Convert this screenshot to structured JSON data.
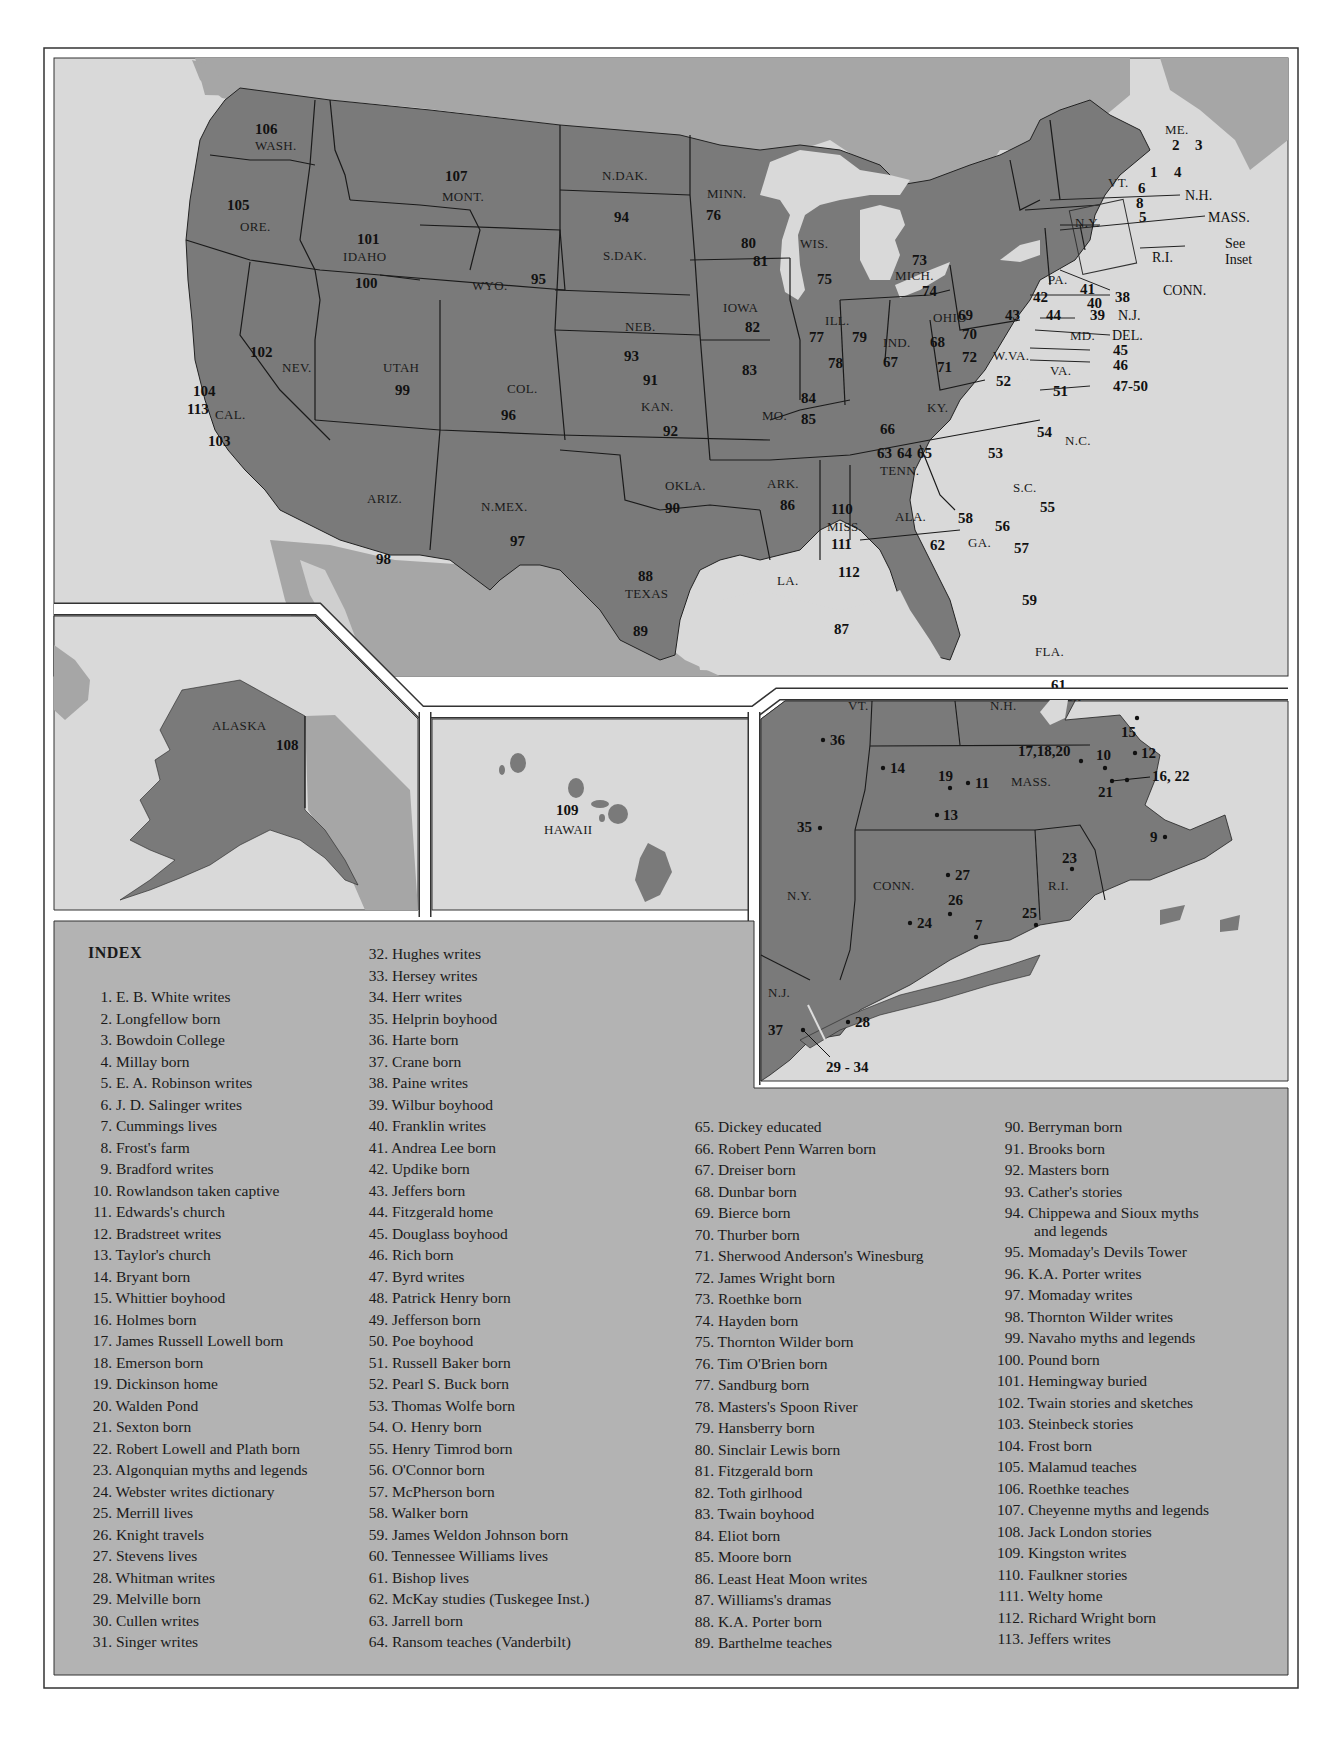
{
  "map": {
    "colors": {
      "us_land": "#7a7a7a",
      "foreign_land": "#a6a6a6",
      "water": "#d9d9d9",
      "index_bg": "#b3b3b3",
      "border": "#1a1a1a",
      "inset_gap": "#ffffff"
    },
    "states": [
      {
        "abbr": "WASH.",
        "numbers": [
          "106"
        ]
      },
      {
        "abbr": "ORE.",
        "numbers": [
          "105"
        ]
      },
      {
        "abbr": "CAL.",
        "numbers": [
          "104",
          "113",
          "103"
        ]
      },
      {
        "abbr": "NEV.",
        "numbers": [
          "102"
        ]
      },
      {
        "abbr": "IDAHO",
        "numbers": [
          "101",
          "100"
        ]
      },
      {
        "abbr": "MONT.",
        "numbers": [
          "107"
        ]
      },
      {
        "abbr": "WYO.",
        "numbers": [
          "95"
        ]
      },
      {
        "abbr": "UTAH",
        "numbers": [
          "99"
        ]
      },
      {
        "abbr": "COL.",
        "numbers": [
          "96"
        ]
      },
      {
        "abbr": "ARIZ.",
        "numbers": [
          "98"
        ]
      },
      {
        "abbr": "N.MEX.",
        "numbers": [
          "97"
        ]
      },
      {
        "abbr": "N.DAK.",
        "numbers": []
      },
      {
        "abbr": "S.DAK.",
        "numbers": [
          "94"
        ]
      },
      {
        "abbr": "NEB.",
        "numbers": [
          "93"
        ]
      },
      {
        "abbr": "KAN.",
        "numbers": [
          "91",
          "92"
        ]
      },
      {
        "abbr": "OKLA.",
        "numbers": [
          "90"
        ]
      },
      {
        "abbr": "TEXAS",
        "numbers": [
          "88",
          "89"
        ]
      },
      {
        "abbr": "MINN.",
        "numbers": [
          "76",
          "80",
          "81"
        ]
      },
      {
        "abbr": "IOWA",
        "numbers": [
          "82"
        ]
      },
      {
        "abbr": "MO.",
        "numbers": [
          "83",
          "84",
          "85"
        ]
      },
      {
        "abbr": "ARK.",
        "numbers": [
          "86"
        ]
      },
      {
        "abbr": "LA.",
        "numbers": [
          "87"
        ]
      },
      {
        "abbr": "WIS.",
        "numbers": [
          "75"
        ]
      },
      {
        "abbr": "ILL.",
        "numbers": [
          "77",
          "79",
          "78"
        ]
      },
      {
        "abbr": "MICH.",
        "numbers": [
          "73",
          "74"
        ]
      },
      {
        "abbr": "IND.",
        "numbers": [
          "67"
        ]
      },
      {
        "abbr": "OHIO",
        "numbers": [
          "68",
          "69",
          "70",
          "71",
          "72"
        ]
      },
      {
        "abbr": "KY.",
        "numbers": [
          "66"
        ]
      },
      {
        "abbr": "TENN.",
        "numbers": [
          "63",
          "64",
          "65"
        ]
      },
      {
        "abbr": "MISS.",
        "numbers": [
          "110",
          "111",
          "112"
        ]
      },
      {
        "abbr": "ALA.",
        "numbers": [
          "62"
        ]
      },
      {
        "abbr": "GA.",
        "numbers": [
          "58",
          "56",
          "57"
        ]
      },
      {
        "abbr": "FLA.",
        "numbers": [
          "59",
          "61",
          "60"
        ]
      },
      {
        "abbr": "S.C.",
        "numbers": [
          "55"
        ]
      },
      {
        "abbr": "N.C.",
        "numbers": [
          "54",
          "53"
        ]
      },
      {
        "abbr": "VA.",
        "numbers": [
          "51"
        ]
      },
      {
        "abbr": "W.VA.",
        "numbers": [
          "52"
        ]
      },
      {
        "abbr": "PA.",
        "numbers": [
          "42",
          "41",
          "40",
          "43",
          "44"
        ]
      },
      {
        "abbr": "N.Y.",
        "numbers": []
      },
      {
        "abbr": "VT.",
        "numbers": []
      },
      {
        "abbr": "ME.",
        "numbers": [
          "2",
          "3",
          "1",
          "4"
        ]
      },
      {
        "abbr": "N.H.",
        "numbers": [
          "6",
          "8",
          "5"
        ]
      },
      {
        "abbr": "ALASKA",
        "numbers": [
          "108"
        ]
      },
      {
        "abbr": "HAWAII",
        "numbers": [
          "109"
        ]
      }
    ],
    "callouts": [
      {
        "label": "N.H."
      },
      {
        "label": "MASS."
      },
      {
        "label": "See"
      },
      {
        "label": "Inset"
      },
      {
        "label": "R.I."
      },
      {
        "label": "CONN."
      },
      {
        "label": "38"
      },
      {
        "label": "39"
      },
      {
        "label": "N.J."
      },
      {
        "label": "DEL."
      },
      {
        "label": "45"
      },
      {
        "label": "46"
      },
      {
        "label": "47-50"
      },
      {
        "label": "MD."
      }
    ],
    "inset": {
      "states": [
        "VT.",
        "N.H.",
        "MASS.",
        "N.Y.",
        "CONN.",
        "R.I.",
        "N.J."
      ],
      "points": [
        "36",
        "14",
        "19",
        "11",
        "13",
        "35",
        "17,18,20",
        "10",
        "15",
        "12",
        "16, 22",
        "21",
        "9",
        "23",
        "27",
        "26",
        "24",
        "7",
        "25",
        "37",
        "28",
        "29 - 34"
      ]
    }
  },
  "index": {
    "title": "INDEX",
    "col1": [
      {
        "n": "1.",
        "t": "E. B. White writes"
      },
      {
        "n": "2.",
        "t": "Longfellow born"
      },
      {
        "n": "3.",
        "t": "Bowdoin College"
      },
      {
        "n": "4.",
        "t": "Millay born"
      },
      {
        "n": "5.",
        "t": "E. A. Robinson writes"
      },
      {
        "n": "6.",
        "t": "J. D. Salinger writes"
      },
      {
        "n": "7.",
        "t": "Cummings lives"
      },
      {
        "n": "8.",
        "t": "Frost's farm"
      },
      {
        "n": "9.",
        "t": "Bradford writes"
      },
      {
        "n": "10.",
        "t": "Rowlandson taken captive"
      },
      {
        "n": "11.",
        "t": "Edwards's church"
      },
      {
        "n": "12.",
        "t": "Bradstreet writes"
      },
      {
        "n": "13.",
        "t": "Taylor's church"
      },
      {
        "n": "14.",
        "t": "Bryant born"
      },
      {
        "n": "15.",
        "t": "Whittier boyhood"
      },
      {
        "n": "16.",
        "t": "Holmes born"
      },
      {
        "n": "17.",
        "t": "James Russell Lowell born"
      },
      {
        "n": "18.",
        "t": "Emerson born"
      },
      {
        "n": "19.",
        "t": "Dickinson home"
      },
      {
        "n": "20.",
        "t": "Walden Pond"
      },
      {
        "n": "21.",
        "t": "Sexton born"
      },
      {
        "n": "22.",
        "t": "Robert Lowell and Plath born"
      },
      {
        "n": "23.",
        "t": "Algonquian myths and legends"
      },
      {
        "n": "24.",
        "t": "Webster writes dictionary"
      },
      {
        "n": "25.",
        "t": "Merrill lives"
      },
      {
        "n": "26.",
        "t": "Knight travels"
      },
      {
        "n": "27.",
        "t": "Stevens lives"
      },
      {
        "n": "28.",
        "t": "Whitman writes"
      },
      {
        "n": "29.",
        "t": "Melville born"
      },
      {
        "n": "30.",
        "t": "Cullen writes"
      },
      {
        "n": "31.",
        "t": "Singer writes"
      }
    ],
    "col2": [
      {
        "n": "32.",
        "t": "Hughes writes"
      },
      {
        "n": "33.",
        "t": "Hersey writes"
      },
      {
        "n": "34.",
        "t": "Herr writes"
      },
      {
        "n": "35.",
        "t": "Helprin boyhood"
      },
      {
        "n": "36.",
        "t": "Harte born"
      },
      {
        "n": "37.",
        "t": "Crane born"
      },
      {
        "n": "38.",
        "t": "Paine writes"
      },
      {
        "n": "39.",
        "t": "Wilbur boyhood"
      },
      {
        "n": "40.",
        "t": "Franklin writes"
      },
      {
        "n": "41.",
        "t": "Andrea Lee born"
      },
      {
        "n": "42.",
        "t": "Updike born"
      },
      {
        "n": "43.",
        "t": "Jeffers born"
      },
      {
        "n": "44.",
        "t": "Fitzgerald home"
      },
      {
        "n": "45.",
        "t": "Douglass boyhood"
      },
      {
        "n": "46.",
        "t": "Rich born"
      },
      {
        "n": "47.",
        "t": "Byrd writes"
      },
      {
        "n": "48.",
        "t": "Patrick Henry born"
      },
      {
        "n": "49.",
        "t": "Jefferson born"
      },
      {
        "n": "50.",
        "t": "Poe boyhood"
      },
      {
        "n": "51.",
        "t": "Russell Baker born"
      },
      {
        "n": "52.",
        "t": "Pearl S. Buck born"
      },
      {
        "n": "53.",
        "t": "Thomas Wolfe born"
      },
      {
        "n": "54.",
        "t": "O. Henry born"
      },
      {
        "n": "55.",
        "t": "Henry Timrod born"
      },
      {
        "n": "56.",
        "t": "O'Connor born"
      },
      {
        "n": "57.",
        "t": "McPherson born"
      },
      {
        "n": "58.",
        "t": "Walker born"
      },
      {
        "n": "59.",
        "t": "James Weldon Johnson born"
      },
      {
        "n": "60.",
        "t": "Tennessee Williams lives"
      },
      {
        "n": "61.",
        "t": "Bishop lives"
      },
      {
        "n": "62.",
        "t": "McKay studies (Tuskegee Inst.)"
      },
      {
        "n": "63.",
        "t": "Jarrell born"
      },
      {
        "n": "64.",
        "t": "Ransom teaches (Vanderbilt)"
      }
    ],
    "col3": [
      {
        "n": "65.",
        "t": "Dickey educated"
      },
      {
        "n": "66.",
        "t": "Robert Penn Warren born"
      },
      {
        "n": "67.",
        "t": "Dreiser born"
      },
      {
        "n": "68.",
        "t": "Dunbar born"
      },
      {
        "n": "69.",
        "t": "Bierce born"
      },
      {
        "n": "70.",
        "t": "Thurber born"
      },
      {
        "n": "71.",
        "t": "Sherwood Anderson's Winesburg"
      },
      {
        "n": "72.",
        "t": "James Wright born"
      },
      {
        "n": "73.",
        "t": "Roethke born"
      },
      {
        "n": "74.",
        "t": "Hayden born"
      },
      {
        "n": "75.",
        "t": "Thornton Wilder born"
      },
      {
        "n": "76.",
        "t": "Tim O'Brien born"
      },
      {
        "n": "77.",
        "t": "Sandburg born"
      },
      {
        "n": "78.",
        "t": "Masters's Spoon River"
      },
      {
        "n": "79.",
        "t": "Hansberry born"
      },
      {
        "n": "80.",
        "t": "Sinclair Lewis born"
      },
      {
        "n": "81.",
        "t": "Fitzgerald born"
      },
      {
        "n": "82.",
        "t": "Toth girlhood"
      },
      {
        "n": "83.",
        "t": "Twain boyhood"
      },
      {
        "n": "84.",
        "t": "Eliot born"
      },
      {
        "n": "85.",
        "t": "Moore born"
      },
      {
        "n": "86.",
        "t": "Least Heat Moon writes"
      },
      {
        "n": "87.",
        "t": "Williams's dramas"
      },
      {
        "n": "88.",
        "t": "K.A. Porter born"
      },
      {
        "n": "89.",
        "t": "Barthelme teaches"
      }
    ],
    "col4": [
      {
        "n": "90.",
        "t": "Berryman born"
      },
      {
        "n": "91.",
        "t": "Brooks born"
      },
      {
        "n": "92.",
        "t": "Masters born"
      },
      {
        "n": "93.",
        "t": "Cather's stories"
      },
      {
        "n": "94.",
        "t": "Chippewa and Sioux myths",
        "cont": "and legends"
      },
      {
        "n": "95.",
        "t": "Momaday's Devils Tower"
      },
      {
        "n": "96.",
        "t": "K.A. Porter writes"
      },
      {
        "n": "97.",
        "t": "Momaday writes"
      },
      {
        "n": "98.",
        "t": "Thornton Wilder writes"
      },
      {
        "n": "99.",
        "t": "Navaho myths and legends"
      },
      {
        "n": "100.",
        "t": "Pound born"
      },
      {
        "n": "101.",
        "t": "Hemingway buried"
      },
      {
        "n": "102.",
        "t": "Twain stories and sketches"
      },
      {
        "n": "103.",
        "t": "Steinbeck stories"
      },
      {
        "n": "104.",
        "t": "Frost born"
      },
      {
        "n": "105.",
        "t": "Malamud teaches"
      },
      {
        "n": "106.",
        "t": "Roethke teaches"
      },
      {
        "n": "107.",
        "t": "Cheyenne myths and legends"
      },
      {
        "n": "108.",
        "t": "Jack London stories"
      },
      {
        "n": "109.",
        "t": "Kingston writes"
      },
      {
        "n": "110.",
        "t": "Faulkner stories"
      },
      {
        "n": "111.",
        "t": "Welty home"
      },
      {
        "n": "112.",
        "t": "Richard Wright born"
      },
      {
        "n": "113.",
        "t": "Jeffers writes"
      }
    ]
  }
}
